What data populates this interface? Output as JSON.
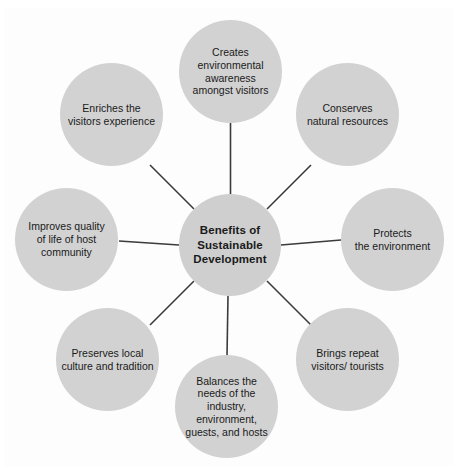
{
  "diagram": {
    "type": "radial-hub-and-spoke",
    "center": {
      "id": "benefits-of-sustainable-development",
      "label": "Benefits of\nSustainable\nDevelopment"
    },
    "nodes": [
      {
        "id": "creates-environmental-awareness",
        "position": "north",
        "label": "Creates\nenvironmental\nawareness\namongst visitors"
      },
      {
        "id": "conserves-natural-resources",
        "position": "northeast",
        "label": "Conserves\nnatural resources"
      },
      {
        "id": "protects-the-environment",
        "position": "east",
        "label": "Protects\nthe environment"
      },
      {
        "id": "brings-repeat-visitors",
        "position": "southeast",
        "label": "Brings repeat\nvisitors/ tourists"
      },
      {
        "id": "balances-the-needs",
        "position": "south",
        "label": "Balances the\nneeds of the industry,\nenvironment,\nguests, and hosts"
      },
      {
        "id": "preserves-local-culture",
        "position": "southwest",
        "label": "Preserves local\nculture and tradition"
      },
      {
        "id": "improves-quality-of-life",
        "position": "west",
        "label": "Improves quality\nof life of host\ncommunity"
      },
      {
        "id": "enriches-visitors-experience",
        "position": "northwest",
        "label": "Enriches the\nvisitors experience"
      }
    ],
    "colors": {
      "node_fill": "#d2d2d2",
      "center_fill": "#cfcfcf",
      "text": "#1a1a1a",
      "connector": "#3b3b3b",
      "panel_background": "#fdfdfd",
      "page_background": "#ffffff"
    }
  }
}
